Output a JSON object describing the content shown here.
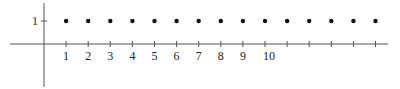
{
  "chart_data": {
    "type": "scatter",
    "title": "",
    "xlabel": "",
    "ylabel": "",
    "x": [
      1,
      2,
      3,
      4,
      5,
      6,
      7,
      8,
      9,
      10,
      11,
      12,
      13,
      14,
      15
    ],
    "y": [
      1,
      1,
      1,
      1,
      1,
      1,
      1,
      1,
      1,
      1,
      1,
      1,
      1,
      1,
      1
    ],
    "x_tick_labels": [
      "1",
      "2",
      "3",
      "4",
      "5",
      "6",
      "7",
      "8",
      "9",
      "10",
      "",
      "",
      "",
      "",
      ""
    ],
    "y_tick_labels": [
      "1"
    ],
    "xlim": [
      -1,
      15.5
    ],
    "ylim": [
      -2,
      1.9
    ],
    "grid": false,
    "legend": null
  },
  "colors": {
    "axis": "#555555",
    "point": "#111111",
    "text": "#222222"
  }
}
